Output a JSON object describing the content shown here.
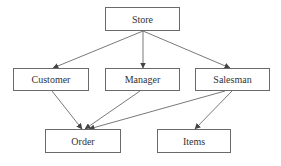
{
  "diagram": {
    "type": "hierarchy",
    "colors": {
      "stroke": "#6a6a6a",
      "text": "#333333",
      "fill": "#ffffff"
    },
    "nodes": [
      {
        "id": "store",
        "label": "Store",
        "x": 105,
        "y": 7,
        "w": 75,
        "h": 24
      },
      {
        "id": "customer",
        "label": "Customer",
        "x": 13,
        "y": 68,
        "w": 76,
        "h": 23
      },
      {
        "id": "manager",
        "label": "Manager",
        "x": 105,
        "y": 68,
        "w": 75,
        "h": 23
      },
      {
        "id": "salesman",
        "label": "Salesman",
        "x": 195,
        "y": 68,
        "w": 75,
        "h": 23
      },
      {
        "id": "order",
        "label": "Order",
        "x": 45,
        "y": 129,
        "w": 76,
        "h": 24
      },
      {
        "id": "items",
        "label": "Items",
        "x": 157,
        "y": 129,
        "w": 74,
        "h": 24
      }
    ],
    "edges": [
      {
        "from": "store",
        "to": "customer",
        "x1": 143,
        "y1": 31,
        "x2": 53,
        "y2": 68
      },
      {
        "from": "store",
        "to": "manager",
        "x1": 143,
        "y1": 31,
        "x2": 143,
        "y2": 68
      },
      {
        "from": "store",
        "to": "salesman",
        "x1": 143,
        "y1": 31,
        "x2": 230,
        "y2": 68
      },
      {
        "from": "customer",
        "to": "order",
        "x1": 52,
        "y1": 91,
        "x2": 82,
        "y2": 129
      },
      {
        "from": "manager",
        "to": "order",
        "x1": 140,
        "y1": 91,
        "x2": 85,
        "y2": 129
      },
      {
        "from": "salesman",
        "to": "order",
        "x1": 225,
        "y1": 91,
        "x2": 89,
        "y2": 129
      },
      {
        "from": "salesman",
        "to": "items",
        "x1": 232,
        "y1": 91,
        "x2": 195,
        "y2": 129
      }
    ]
  }
}
